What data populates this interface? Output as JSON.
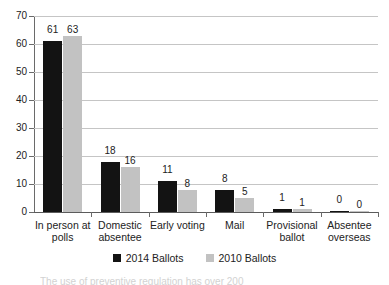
{
  "chart_data": {
    "type": "bar",
    "title": "",
    "subtitle": "",
    "xlabel": "",
    "ylabel": "",
    "ylim": [
      0,
      70
    ],
    "ytick_step": 10,
    "yticks": [
      0,
      10,
      20,
      30,
      40,
      50,
      60,
      70
    ],
    "grid": true,
    "legend_position": "bottom",
    "categories": [
      "In person at polls",
      "Domestic absentee",
      "Early voting",
      "Mail",
      "Provisional ballot",
      "Absentee overseas"
    ],
    "series": [
      {
        "name": "2014 Ballots",
        "color": "#131313",
        "values": [
          61,
          18,
          11,
          8,
          1,
          0
        ]
      },
      {
        "name": "2010 Ballots",
        "color": "#c2c2c2",
        "values": [
          63,
          16,
          8,
          5,
          1,
          0
        ]
      }
    ]
  },
  "legend": {
    "entries": [
      {
        "label": "2014 Ballots",
        "swatch": "series-a"
      },
      {
        "label": "2010 Ballots",
        "swatch": "series-b"
      }
    ]
  },
  "caption": {
    "partial_line": "The use of preventive regulation has over 200"
  },
  "colors": {
    "series_2014": "#131313",
    "series_2010": "#c2c2c2",
    "gridline": "#c5c5c5",
    "axis": "#6a6a6a",
    "text": "#222222",
    "background": "#ffffff"
  }
}
